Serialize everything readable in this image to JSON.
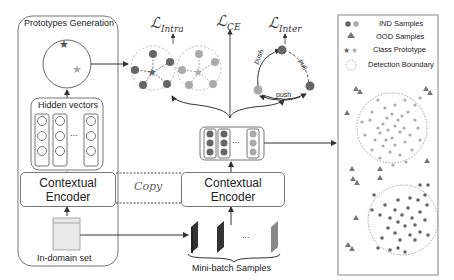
{
  "left_panel": {
    "title": "Prototypes Generation",
    "hidden_vectors_label": "Hidden vectors",
    "encoder_label_line1": "Contextual",
    "encoder_label_line2": "Encoder",
    "dataset_label": "In-domain set",
    "ellipsis": "..."
  },
  "middle": {
    "copy_label": "Copy",
    "encoder_label_line1": "Contextual",
    "encoder_label_line2": "Encoder",
    "minibatch_label": "Mini-batch Samples",
    "ellipsis": "..."
  },
  "losses": {
    "intra": {
      "symbol": "ℒ",
      "subscript": "Intra"
    },
    "ce": {
      "symbol": "ℒ",
      "subscript": "CE"
    },
    "inter": {
      "symbol": "ℒ",
      "subscript": "Inter"
    }
  },
  "inter_diagram": {
    "push_left": "push",
    "pull_right": "pull",
    "push_bottom": "push"
  },
  "legend": {
    "items": [
      {
        "icon": "dark-and-light-circles",
        "label": "IND Samples"
      },
      {
        "icon": "triangle",
        "label": "OOD Samples"
      },
      {
        "icon": "dark-and-light-stars",
        "label": "Class Prototype"
      },
      {
        "icon": "dashed-circle",
        "label": "Detection Boundary"
      }
    ]
  },
  "colors": {
    "dark_class": "#6b6b6b",
    "light_class": "#a8a8a8",
    "border": "#777777",
    "ood_triangle": "#7a7a7a"
  }
}
